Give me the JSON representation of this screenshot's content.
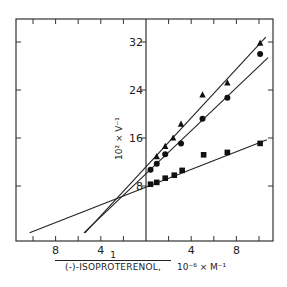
{
  "chart_data": {
    "type": "scatter",
    "title": "",
    "xlabel": {
      "numerator": "1",
      "denominator": "(-)-ISOPROTERENOL,",
      "units": "10⁻⁶ × M⁻¹"
    },
    "ylabel": "10² × V⁻¹",
    "xlim": [
      -11.5,
      11.2
    ],
    "ylim": [
      -1.2,
      35.9
    ],
    "x_ticks": [
      -10,
      -8,
      -6,
      -4,
      -2,
      2,
      4,
      6,
      8,
      10
    ],
    "x_tick_labels": [
      {
        "value": -8,
        "label": "8"
      },
      {
        "value": -4,
        "label": "4"
      },
      {
        "value": 4,
        "label": "4"
      },
      {
        "value": 8,
        "label": "8"
      }
    ],
    "y_ticks": [
      8,
      16,
      24,
      32
    ],
    "y_tick_labels": [
      {
        "value": 8,
        "label": "8"
      },
      {
        "value": 16,
        "label": "16"
      },
      {
        "value": 24,
        "label": "24"
      },
      {
        "value": 32,
        "label": "32"
      }
    ],
    "grid": false,
    "legend": null,
    "series": [
      {
        "name": "triangles",
        "marker": "triangle",
        "points": [
          [
            0.95,
            12.9
          ],
          [
            1.7,
            14.6
          ],
          [
            2.4,
            16.0
          ],
          [
            3.1,
            18.3
          ],
          [
            5.0,
            23.2
          ],
          [
            7.2,
            25.2
          ],
          [
            10.1,
            31.8
          ]
        ],
        "fit_line": [
          [
            -5.4,
            0.2
          ],
          [
            10.6,
            32.8
          ]
        ]
      },
      {
        "name": "circles",
        "marker": "circle",
        "points": [
          [
            0.4,
            10.7
          ],
          [
            0.95,
            11.7
          ],
          [
            1.7,
            13.3
          ],
          [
            3.1,
            15.1
          ],
          [
            5.0,
            19.2
          ],
          [
            7.2,
            22.7
          ],
          [
            10.1,
            30.0
          ]
        ],
        "fit_line": [
          [
            -5.5,
            0.2
          ],
          [
            10.8,
            29.4
          ]
        ]
      },
      {
        "name": "squares",
        "marker": "square",
        "points": [
          [
            0.4,
            8.3
          ],
          [
            0.95,
            8.6
          ],
          [
            1.7,
            9.3
          ],
          [
            2.5,
            9.8
          ],
          [
            3.2,
            10.6
          ],
          [
            5.1,
            13.2
          ],
          [
            7.2,
            13.6
          ],
          [
            10.1,
            15.1
          ]
        ],
        "fit_line": [
          [
            -10.3,
            0.2
          ],
          [
            10.7,
            15.7
          ]
        ]
      }
    ],
    "annotations": [
      "Lines intersect near x = -2.2, y = 6"
    ]
  }
}
